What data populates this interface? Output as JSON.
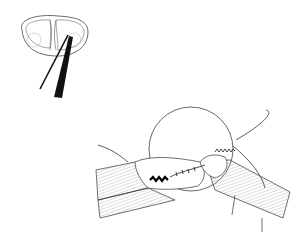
{
  "figure": {
    "type": "surgical line illustration",
    "panels": [
      {
        "name": "inset-cross-section",
        "description": "Cross-section of knee (tibial plateau) with two instruments inserted"
      },
      {
        "name": "magnified-view",
        "description": "Circular magnified view of instruments suturing tissue with stitched repair"
      }
    ],
    "colors": {
      "line": "#1a1a1a",
      "hatch": "#777777",
      "background": "#ffffff"
    }
  }
}
